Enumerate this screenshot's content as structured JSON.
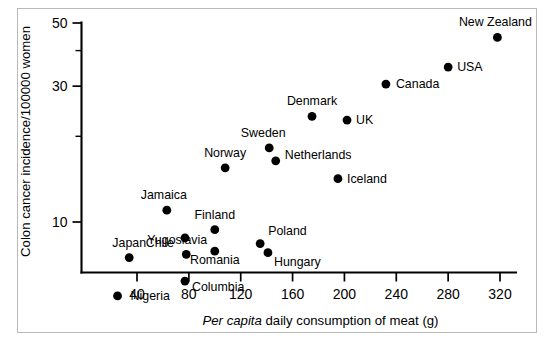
{
  "figure": {
    "background_color": "#ffffff",
    "frame_color": "#b9b9b9",
    "marker_color": "#000000"
  },
  "chart_data": {
    "type": "scatter",
    "title": "",
    "xlabel_italic_prefix": "Per capita",
    "xlabel_rest": " daily consumption of meat (g)",
    "xlabel": "Per capita daily consumption of meat (g)",
    "ylabel": "Colon cancer incidence/100000 women",
    "xlim": [
      20,
      327
    ],
    "ylim": [
      4.6,
      52
    ],
    "yscale": "log",
    "xscale": "linear",
    "grid": false,
    "legend": "none",
    "xticks": [
      40,
      80,
      120,
      160,
      200,
      240,
      280,
      320
    ],
    "xtick_labels": [
      "40",
      "80",
      "120",
      "160",
      "200",
      "240",
      "280",
      "320"
    ],
    "yticks": [
      10,
      30,
      50
    ],
    "ytick_labels": [
      "10",
      "30",
      "50"
    ],
    "yticks_minor": [
      20,
      40
    ],
    "points": [
      {
        "label": "Nigeria",
        "x": 25,
        "y": 5.5,
        "label_dx": 13,
        "label_dy": 4,
        "anchor": "start"
      },
      {
        "label": "Japan",
        "x": 34,
        "y": 7.5,
        "label_dx": 0,
        "label_dy": -11,
        "anchor": "middle"
      },
      {
        "label": "Jamaica",
        "x": 63,
        "y": 11.0,
        "label_dx": -3,
        "label_dy": -11,
        "anchor": "middle"
      },
      {
        "label": "Yugoslavia",
        "x": 78,
        "y": 7.7,
        "label_dx": -9,
        "label_dy": -10,
        "anchor": "middle"
      },
      {
        "label": "Chile",
        "x": 77,
        "y": 8.8,
        "label_dx": -11,
        "label_dy": 9,
        "anchor": "end"
      },
      {
        "label": "Columbia",
        "x": 77,
        "y": 6.2,
        "label_dx": 7,
        "label_dy": 10,
        "anchor": "start"
      },
      {
        "label": "Finland",
        "x": 100,
        "y": 9.4,
        "label_dx": 0,
        "label_dy": -11,
        "anchor": "middle"
      },
      {
        "label": "Romania",
        "x": 100,
        "y": 7.9,
        "label_dx": 0,
        "label_dy": 13,
        "anchor": "middle"
      },
      {
        "label": "Norway",
        "x": 108,
        "y": 15.5,
        "label_dx": 0,
        "label_dy": -11,
        "anchor": "middle"
      },
      {
        "label": "Poland",
        "x": 135,
        "y": 8.4,
        "label_dx": 8,
        "label_dy": -9,
        "anchor": "start"
      },
      {
        "label": "Hungary",
        "x": 141,
        "y": 7.8,
        "label_dx": 6,
        "label_dy": 13,
        "anchor": "start"
      },
      {
        "label": "Sweden",
        "x": 142,
        "y": 18.2,
        "label_dx": -6,
        "label_dy": -11,
        "anchor": "middle"
      },
      {
        "label": "Netherlands",
        "x": 147,
        "y": 16.4,
        "label_dx": 9,
        "label_dy": -2,
        "anchor": "start"
      },
      {
        "label": "Denmark",
        "x": 175,
        "y": 23.5,
        "label_dx": 0,
        "label_dy": -11,
        "anchor": "middle"
      },
      {
        "label": "UK",
        "x": 202,
        "y": 22.8,
        "label_dx": 9,
        "label_dy": 4,
        "anchor": "start"
      },
      {
        "label": "Iceland",
        "x": 195,
        "y": 14.2,
        "label_dx": 9,
        "label_dy": 4,
        "anchor": "start"
      },
      {
        "label": "Canada",
        "x": 232,
        "y": 30.5,
        "label_dx": 10,
        "label_dy": 4,
        "anchor": "start"
      },
      {
        "label": "USA",
        "x": 280,
        "y": 35.0,
        "label_dx": 9,
        "label_dy": 4,
        "anchor": "start"
      },
      {
        "label": "New Zealand",
        "x": 318,
        "y": 44.5,
        "label_dx": -2,
        "label_dy": -11,
        "anchor": "middle"
      }
    ]
  }
}
